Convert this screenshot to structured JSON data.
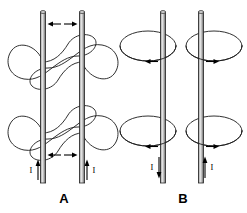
{
  "figure": {
    "background_color": "#ffffff",
    "line_color": "#1a1a1a",
    "wire_color": "#2b2b2b",
    "wire_highlight_color": "#9a9a9a",
    "arrow_color": "#000000"
  },
  "panels": [
    {
      "id": "panel-a",
      "caption": "A",
      "caption_x": 64,
      "caption_y": 203,
      "configuration": "parallel currents",
      "field_pattern": "merged figure-eight loops encircling both wires",
      "force": "attraction",
      "wires": [
        {
          "id": "wire-a-left",
          "x": 43,
          "top_y": 12,
          "bottom_y": 183,
          "current_label": "I",
          "current_direction": "up",
          "label_x": 31,
          "label_y": 173,
          "arrow_x": 38,
          "arrow_top_y": 160,
          "arrow_bottom_y": 180
        },
        {
          "id": "wire-a-right",
          "x": 82,
          "top_y": 12,
          "bottom_y": 183,
          "current_label": "I",
          "current_direction": "up",
          "label_x": 93,
          "label_y": 173,
          "arrow_x": 87,
          "arrow_top_y": 160,
          "arrow_bottom_y": 180
        }
      ],
      "field_lines": [
        {
          "id": "fieldline-a-top",
          "center_y": 62,
          "shape": "pinched-peanut"
        },
        {
          "id": "fieldline-a-bottom",
          "center_y": 133,
          "shape": "pinched-peanut"
        }
      ],
      "separation_arrows": [
        {
          "id": "separation-arrow-top",
          "y": 24,
          "left_x": 48,
          "right_x": 77,
          "direction": "outward"
        },
        {
          "id": "separation-arrow-bottom",
          "y": 155,
          "left_x": 48,
          "right_x": 77,
          "direction": "outward"
        }
      ]
    },
    {
      "id": "panel-b",
      "caption": "B",
      "caption_x": 183,
      "caption_y": 203,
      "configuration": "antiparallel currents",
      "field_pattern": "separate elliptical loops around each wire",
      "force": "repulsion",
      "wires": [
        {
          "id": "wire-b-left",
          "x": 163,
          "top_y": 12,
          "bottom_y": 183,
          "current_label": "I",
          "current_direction": "down",
          "label_x": 153,
          "label_y": 170,
          "arrow_x": 160,
          "arrow_top_y": 158,
          "arrow_bottom_y": 178
        },
        {
          "id": "wire-b-right",
          "x": 201,
          "top_y": 12,
          "bottom_y": 183,
          "current_label": "I",
          "current_direction": "up",
          "label_x": 211,
          "label_y": 170,
          "arrow_x": 205,
          "arrow_top_y": 158,
          "arrow_bottom_y": 178
        }
      ],
      "field_lines": [
        {
          "id": "fieldline-b-left-top",
          "center_x": 148,
          "center_y": 46,
          "rx": 28,
          "ry": 15,
          "circulation_arrow_direction": "left",
          "arrow_x": 150,
          "arrow_y": 62
        },
        {
          "id": "fieldline-b-left-bottom",
          "center_x": 148,
          "center_y": 131,
          "rx": 28,
          "ry": 15,
          "circulation_arrow_direction": "left",
          "arrow_x": 150,
          "arrow_y": 147
        },
        {
          "id": "fieldline-b-right-top",
          "center_x": 214,
          "center_y": 46,
          "rx": 28,
          "ry": 15,
          "circulation_arrow_direction": "right",
          "arrow_x": 208,
          "arrow_y": 62
        },
        {
          "id": "fieldline-b-right-bottom",
          "center_x": 214,
          "center_y": 131,
          "rx": 28,
          "ry": 15,
          "circulation_arrow_direction": "right",
          "arrow_x": 208,
          "arrow_y": 147
        }
      ]
    }
  ]
}
